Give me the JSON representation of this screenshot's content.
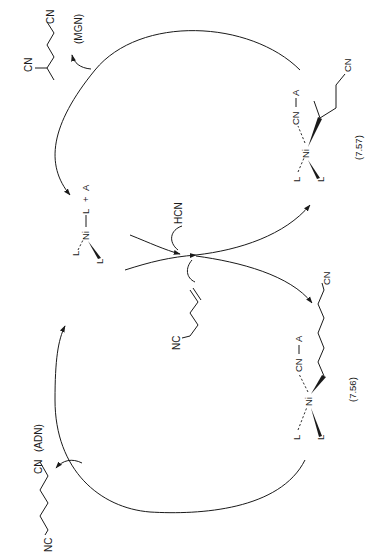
{
  "figure": {
    "orientation": "rotated 90 degrees counter-clockwise"
  },
  "labels": {
    "mgn_product": {
      "cn_top": "CN",
      "cn_end": "CN",
      "name": "(MGN)"
    },
    "adn_product": {
      "nc": "NC",
      "cn": "CN",
      "name": "(ADN)"
    },
    "catalyst": {
      "l1": "L",
      "ni": "Ni",
      "l2": "L",
      "l3": "L",
      "plus": "+",
      "a": "A"
    },
    "reagents": {
      "hcn": "HCN",
      "substrate_nc": "NC"
    },
    "intermediate_757": {
      "l1": "L",
      "ni": "Ni",
      "l2": "L",
      "cn": "CN",
      "a": "A",
      "chain_cn": "CN",
      "number": "(7.57)"
    },
    "intermediate_756": {
      "l1": "L",
      "ni": "Ni",
      "l2": "L",
      "cn": "CN",
      "a": "A",
      "chain_cn": "CN",
      "number": "(7.56)"
    }
  },
  "colors": {
    "ink": "#1a1a1a",
    "background": "#ffffff"
  }
}
